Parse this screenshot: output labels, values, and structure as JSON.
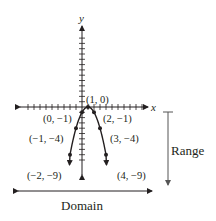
{
  "chart_data": {
    "type": "line",
    "title": "",
    "function": "y = -(x - 1)^2",
    "xlabel": "x",
    "ylabel": "y",
    "grid": false,
    "x_tick_step": 1,
    "y_tick_step": 1,
    "xlim": [
      -10,
      11
    ],
    "ylim": [
      -10,
      10
    ],
    "series": [
      {
        "name": "parabola",
        "points": [
          {
            "x": -2,
            "y": -9,
            "label": "(−2, −9)"
          },
          {
            "x": -1,
            "y": -4,
            "label": "(−1, −4)"
          },
          {
            "x": 0,
            "y": -1,
            "label": "(0, −1)"
          },
          {
            "x": 1,
            "y": 0,
            "label": "(1, 0)"
          },
          {
            "x": 2,
            "y": -1,
            "label": "(2, −1)"
          },
          {
            "x": 3,
            "y": -4,
            "label": "(3, −4)"
          },
          {
            "x": 4,
            "y": -9,
            "label": "(4, −9)"
          }
        ]
      }
    ],
    "annotations": [
      {
        "text": "Domain",
        "type": "double-arrow",
        "orientation": "horizontal"
      },
      {
        "text": "Range",
        "type": "bracket-arrow",
        "orientation": "vertical",
        "direction": "down"
      }
    ]
  },
  "labels": {
    "x_axis": "x",
    "y_axis": "y",
    "domain": "Domain",
    "range": "Range",
    "p_m2": "(−2, −9)",
    "p_m1": "(−1, −4)",
    "p_0": "(0, −1)",
    "p_1": "(1, 0)",
    "p_2": "(2, −1)",
    "p_3": "(3, −4)",
    "p_4": "(4, −9)"
  },
  "colors": {
    "ink": "#231f20",
    "range_arrow": "#555555"
  }
}
